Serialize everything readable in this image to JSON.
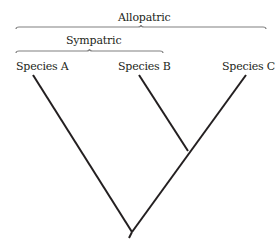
{
  "diagram": {
    "type": "phylogenetic-tree",
    "colors": {
      "line": "#231f20",
      "bracket": "#808080",
      "text": "#231f20",
      "background": "#ffffff"
    },
    "brackets": [
      {
        "id": "allopatric",
        "label": "Allopatric",
        "x1": 16,
        "x2": 266,
        "y": 27,
        "label_x": 118,
        "label_y": 12
      },
      {
        "id": "sympatric",
        "label": "Sympatric",
        "x1": 16,
        "x2": 163,
        "y": 51,
        "label_x": 66,
        "label_y": 35
      }
    ],
    "species": [
      {
        "id": "a",
        "label": "Species A",
        "label_x": 16,
        "label_y": 61,
        "tip": [
          33,
          75
        ]
      },
      {
        "id": "b",
        "label": "Species B",
        "label_x": 118,
        "label_y": 61,
        "tip": [
          139,
          75
        ]
      },
      {
        "id": "c",
        "label": "Species C",
        "label_x": 222,
        "label_y": 61,
        "tip": [
          246,
          75
        ]
      }
    ],
    "nodes": {
      "bc": [
        188,
        151
      ],
      "root": [
        132,
        232
      ],
      "root_stem_end": [
        129,
        238
      ]
    }
  }
}
